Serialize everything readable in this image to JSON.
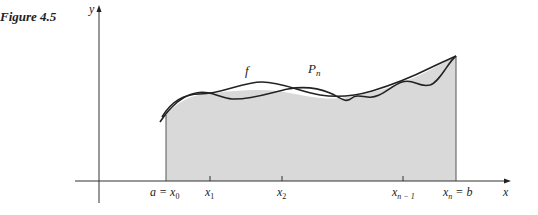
{
  "figure": {
    "label": "Figure 4.5"
  },
  "axes": {
    "x_label": "x",
    "y_label": "y"
  },
  "curves": {
    "f_label": "f",
    "p_label": "P",
    "p_subscript": "n"
  },
  "ticks": [
    {
      "main": "a = x",
      "sub": "0"
    },
    {
      "main": "x",
      "sub": "1"
    },
    {
      "main": "x",
      "sub": "2"
    },
    {
      "main": "x",
      "sub": "n − 1"
    },
    {
      "main": "x",
      "sub": "n",
      "suffix": " = b"
    }
  ],
  "colors": {
    "shade": "#d9d9d9",
    "stroke": "#222222"
  }
}
